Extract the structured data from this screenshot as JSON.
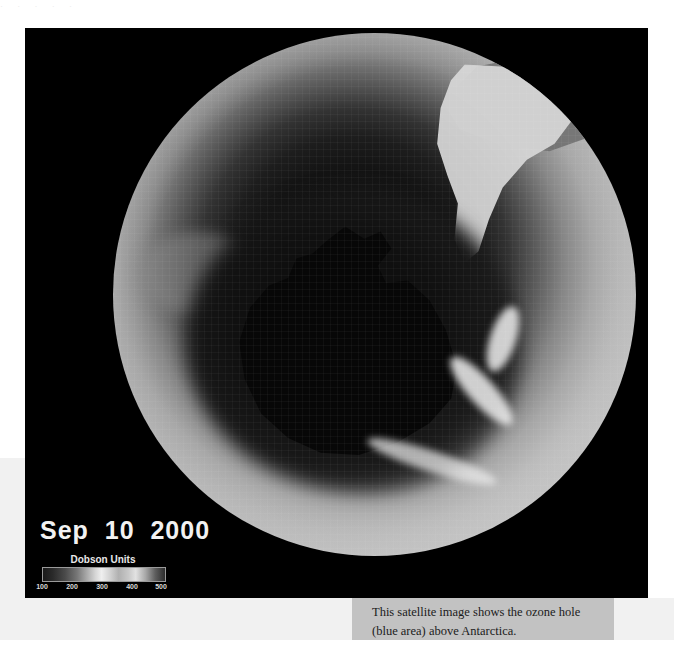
{
  "page": {
    "top_bleed_text": "·        ·            ·       ·        ·"
  },
  "satellite_image": {
    "name": "ozone-hole-satellite-image",
    "date_label": "Sep  10  2000",
    "legend": {
      "title": "Dobson Units",
      "ticks": [
        "100",
        "200",
        "300",
        "400",
        "500"
      ],
      "tick_positions_pct": [
        0,
        25,
        50,
        75,
        100
      ],
      "min": 100,
      "max": 500
    },
    "features": {
      "ozone_hole_label": "ozone hole",
      "continent_label": "Antarctica",
      "landmass_label": "South America"
    }
  },
  "caption": {
    "text": "This satellite image shows the ozone hole (blue area) above Antarctica."
  },
  "colors": {
    "plate_background": "#000000",
    "page_band": "#f1f1f1",
    "caption_background": "#c2c2c2",
    "caption_text": "#1b1b1b",
    "date_text": "#f2f2f2",
    "legend_text": "#e8e8e8"
  }
}
